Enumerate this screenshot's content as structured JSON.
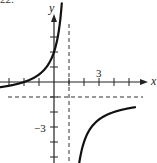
{
  "figure_number": "22.",
  "chart_data": {
    "type": "line",
    "title": "",
    "function": "f(x) = (x + 2) / (1 - x)",
    "xlabel": "x",
    "ylabel": "y",
    "xlim": [
      -3.5,
      6.2
    ],
    "ylim": [
      -5.4,
      5.2
    ],
    "grid": false,
    "tick_spacing": 1,
    "x_ticks": [
      -3,
      -2,
      -1,
      1,
      2,
      3,
      4,
      5
    ],
    "y_ticks": [
      -5,
      -4,
      -3,
      -2,
      -1,
      1,
      2,
      3
    ],
    "tick_labels": [
      {
        "axis": "x",
        "value": 3,
        "text": "3"
      },
      {
        "axis": "y",
        "value": -3,
        "text": "−3"
      }
    ],
    "asymptotes": [
      {
        "type": "vertical",
        "value": 1,
        "style": "dashed"
      },
      {
        "type": "horizontal",
        "value": -1,
        "style": "dashed"
      }
    ],
    "intercepts": {
      "x": -2,
      "y": 2
    },
    "series": [
      {
        "name": "left-branch",
        "x": [
          -3.6,
          -3,
          -2,
          -1,
          0,
          0.3,
          0.5
        ],
        "y": [
          -0.35,
          -0.25,
          0,
          0.5,
          2,
          3.29,
          5
        ]
      },
      {
        "name": "right-branch",
        "x": [
          1.66,
          2,
          2.5,
          3,
          4,
          5,
          5.4
        ],
        "y": [
          -5.5,
          -4,
          -3,
          -2.5,
          -2,
          -1.75,
          -1.68
        ]
      }
    ]
  },
  "labels": {
    "x_axis": "x",
    "y_axis": "y",
    "tick_x_3": "3",
    "tick_y_neg3": "−3"
  }
}
